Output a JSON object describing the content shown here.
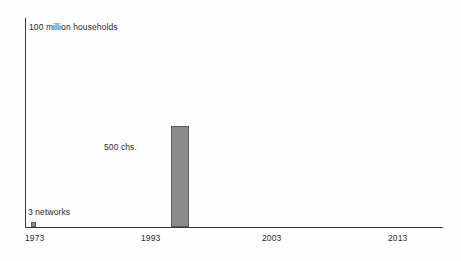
{
  "chart_data": {
    "type": "bar",
    "title": "",
    "subtitle": "",
    "xlabel": "",
    "ylabel": "100 million households",
    "categories": [
      "1973",
      "1993"
    ],
    "values": [
      3,
      500
    ],
    "x": [
      1973,
      1993
    ],
    "xlim": [
      1973,
      2017
    ],
    "ylim": [
      0,
      100000000
    ],
    "grid": false,
    "legend": null,
    "axis": {
      "x_ticks": [
        "1973",
        "1993",
        "2003",
        "2013"
      ],
      "y_top_label": "100 million households"
    },
    "annotations": [
      {
        "text": "3 networks",
        "at_category": "1973"
      },
      {
        "text": "500 chs.",
        "at_category": "1993"
      }
    ],
    "series": [
      {
        "name": "US TV households reached",
        "values": [
          3,
          500
        ],
        "labels": [
          "3 networks",
          "500 chs."
        ]
      }
    ],
    "colors": {
      "bar_fill": "#8c8c8c",
      "bar_border": "#5d5d5d",
      "axis": "#3a3a3a",
      "text": "#2b2b2b",
      "background": "#fefefe"
    }
  },
  "labels": {
    "y_axis_title": "100 million households",
    "annotation_networks": "3 networks",
    "annotation_channels": "500 chs.",
    "tick_1973": "1973",
    "tick_1993": "1993",
    "tick_2003": "2003",
    "tick_2013": "2013"
  }
}
